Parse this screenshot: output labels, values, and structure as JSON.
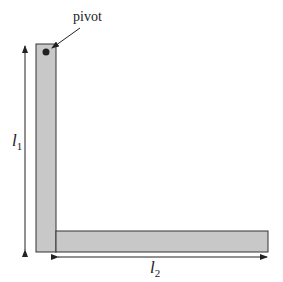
{
  "diagram": {
    "labels": {
      "pivot": "pivot",
      "l1_main": "l",
      "l1_sub": "1",
      "l2_main": "l",
      "l2_sub": "2"
    },
    "colors": {
      "bar_fill": "#c8c8c8",
      "bar_stroke": "#333333",
      "arrow": "#222222",
      "pivot_dot": "#222222"
    },
    "shapes": {
      "vertical_bar": {
        "x": 36,
        "y": 44,
        "w": 20,
        "h": 208
      },
      "horizontal_bar": {
        "x": 56,
        "y": 231,
        "w": 212,
        "h": 21
      },
      "pivot_point": {
        "x": 46,
        "y": 52
      }
    }
  }
}
